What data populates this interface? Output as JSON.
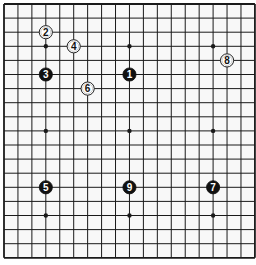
{
  "board": {
    "size": 19,
    "background": "#f8f8f8",
    "line_color": "#1a1a1a",
    "origin_x": 4,
    "origin_y": 4,
    "spacing_x": 13.94,
    "spacing_y": 14.1,
    "stone_radius": 6.6,
    "star_points": [
      [
        3,
        3
      ],
      [
        9,
        3
      ],
      [
        15,
        3
      ],
      [
        3,
        9
      ],
      [
        9,
        9
      ],
      [
        15,
        9
      ],
      [
        3,
        15
      ],
      [
        9,
        15
      ],
      [
        15,
        15
      ]
    ]
  },
  "stones": [
    {
      "move": "1",
      "color": "black",
      "col": 9,
      "row": 5
    },
    {
      "move": "2",
      "color": "white",
      "col": 3,
      "row": 2
    },
    {
      "move": "3",
      "color": "black",
      "col": 3,
      "row": 5
    },
    {
      "move": "4",
      "color": "white",
      "col": 5,
      "row": 3
    },
    {
      "move": "5",
      "color": "black",
      "col": 3,
      "row": 13
    },
    {
      "move": "6",
      "color": "white",
      "col": 6,
      "row": 6
    },
    {
      "move": "7",
      "color": "black",
      "col": 15,
      "row": 13
    },
    {
      "move": "8",
      "color": "white",
      "col": 16,
      "row": 4
    },
    {
      "move": "9",
      "color": "black",
      "col": 9,
      "row": 13
    }
  ]
}
